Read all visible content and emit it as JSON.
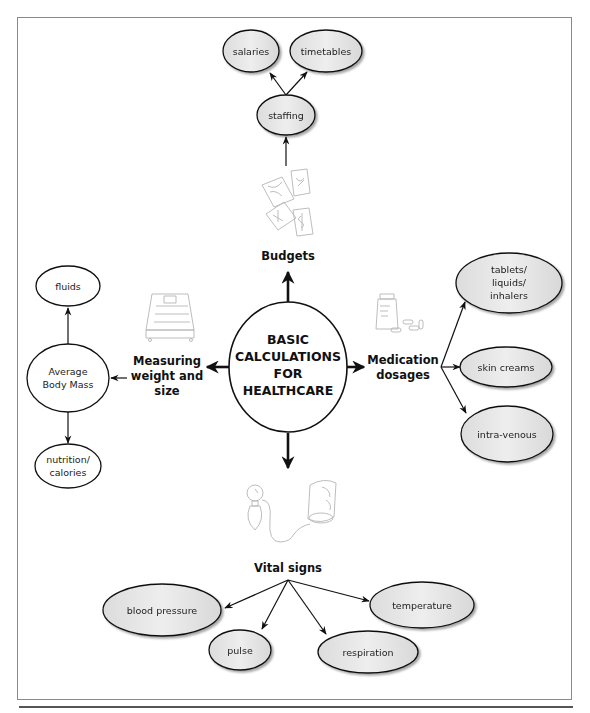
{
  "center": {
    "lines": [
      "BASIC",
      "CALCULATIONS",
      "FOR",
      "HEALTHCARE"
    ]
  },
  "colors": {
    "line": "#111111",
    "node_fill_gray": "#e4e4e4",
    "node_fill_white": "#ffffff",
    "frame": "#8a8a8a"
  },
  "branches": {
    "budgets": {
      "label": "Budgets",
      "illustration": "banknotes-icon",
      "child": {
        "label": "staffing"
      },
      "grandchildren": [
        {
          "label": "salaries"
        },
        {
          "label": "timetables"
        }
      ]
    },
    "measuring": {
      "label_lines": [
        "Measuring",
        "weight and",
        "size"
      ],
      "illustration": "weighing-scale-icon",
      "child": {
        "label_lines": [
          "Average",
          "Body Mass"
        ]
      },
      "grandchildren": [
        {
          "label_lines": [
            "fluids"
          ]
        },
        {
          "label_lines": [
            "nutrition/",
            "calories"
          ]
        }
      ]
    },
    "medication": {
      "label_lines": [
        "Medication",
        "dosages"
      ],
      "illustration": "pill-bottle-icon",
      "children": [
        {
          "label_lines": [
            "tablets/",
            "liquids/",
            "inhalers"
          ]
        },
        {
          "label_lines": [
            "skin creams"
          ]
        },
        {
          "label_lines": [
            "intra-venous"
          ]
        }
      ]
    },
    "vital_signs": {
      "label": "Vital signs",
      "illustration": "blood-pressure-monitor-icon",
      "children": [
        {
          "label": "blood pressure"
        },
        {
          "label": "pulse"
        },
        {
          "label": "respiration"
        },
        {
          "label": "temperature"
        }
      ]
    }
  }
}
